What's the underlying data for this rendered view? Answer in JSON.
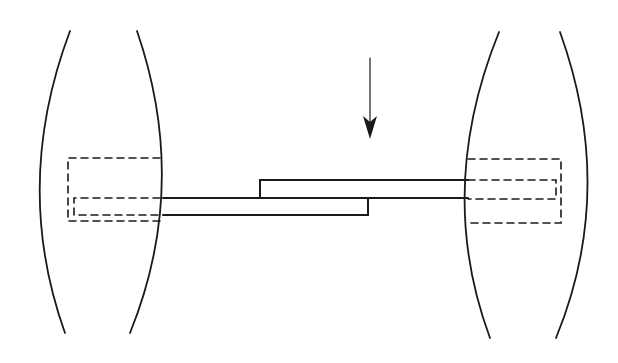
{
  "diagram": {
    "description": "Two lens-shaped (biconvex) bodies connected by two stepped overlapping strips, with dashed outlines showing embedded portions and a downward arrow indicating applied force",
    "colors": {
      "background": "#ffffff",
      "stroke": "#1a1a1a"
    },
    "elements": {
      "left_body": "left-lens-body",
      "right_body": "right-lens-body",
      "upper_strip": "upper-stepped-strip",
      "lower_strip": "lower-stepped-strip",
      "arrow": "downward-force-arrow",
      "left_embedded": "left-dashed-embedded-region",
      "right_embedded": "right-dashed-embedded-region"
    }
  }
}
